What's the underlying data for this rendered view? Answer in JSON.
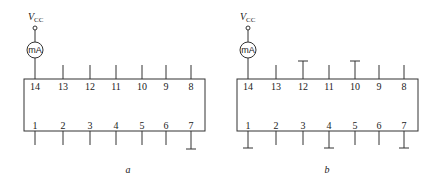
{
  "diagrams": [
    {
      "id": "a",
      "caption": "a",
      "supply": {
        "label": "V",
        "sub": "CC"
      },
      "meter": {
        "label": "mA",
        "connected_pin": 14
      },
      "top_pins": [
        "14",
        "13",
        "12",
        "11",
        "10",
        "9",
        "8"
      ],
      "bottom_pins": [
        "1",
        "2",
        "3",
        "4",
        "5",
        "6",
        "7"
      ],
      "grounded_pins": [
        7
      ]
    },
    {
      "id": "b",
      "caption": "b",
      "supply": {
        "label": "V",
        "sub": "CC"
      },
      "meter": {
        "label": "mA",
        "connected_pin": 14
      },
      "top_pins": [
        "14",
        "13",
        "12",
        "11",
        "10",
        "9",
        "8"
      ],
      "bottom_pins": [
        "1",
        "2",
        "3",
        "4",
        "5",
        "6",
        "7"
      ],
      "grounded_pins": [
        1,
        4,
        7,
        10,
        12
      ]
    }
  ]
}
